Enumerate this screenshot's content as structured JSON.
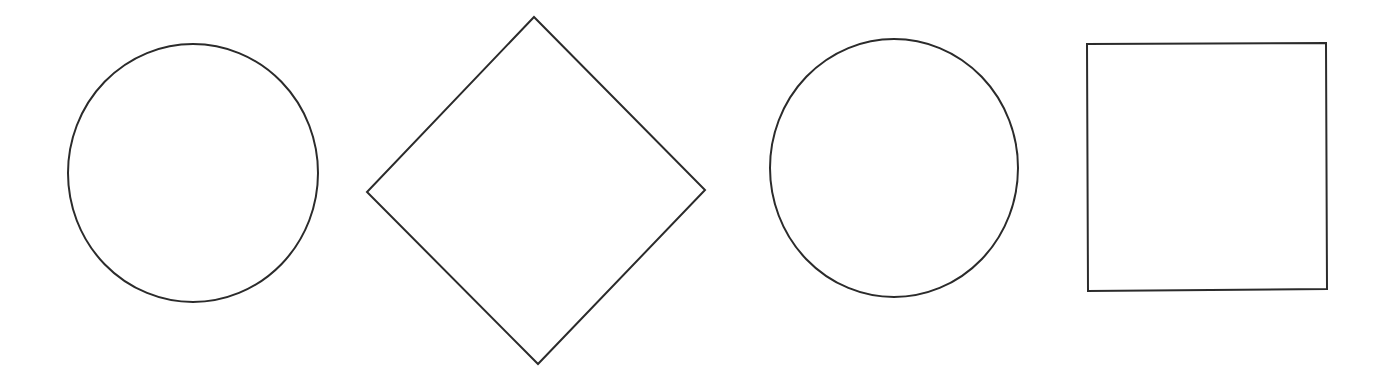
{
  "canvas": {
    "width": 1381,
    "height": 387,
    "background": "#ffffff",
    "stroke_color": "#2b2b2b",
    "stroke_width": 2
  },
  "shapes": [
    {
      "type": "circle",
      "cx": 193,
      "cy": 173,
      "rx": 125,
      "ry": 129
    },
    {
      "type": "diamond",
      "points": "534,17 705,190 538,364 367,192"
    },
    {
      "type": "circle",
      "cx": 894,
      "cy": 168,
      "rx": 124,
      "ry": 129
    },
    {
      "type": "square",
      "points": "1087,44 1326,43 1327,289 1088,291"
    }
  ]
}
